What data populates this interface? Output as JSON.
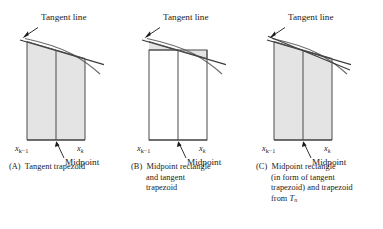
{
  "figure": {
    "type": "math-diagram",
    "fill_color": "#e4e4e4",
    "stroke_color": "#3a3a3a",
    "curve_color": "#555555",
    "background": "#ffffff"
  },
  "labels": {
    "tangent_line": "Tangent line",
    "midpoint": "Midpoint",
    "x_left_main": "x",
    "x_left_sub": "k−1",
    "x_right_main": "x",
    "x_right_sub": "k"
  },
  "panels": [
    {
      "id": "A",
      "tag": "(A)",
      "caption_lines": [
        "Tangent trapezoid"
      ],
      "shaded": "tangent-trapezoid-body"
    },
    {
      "id": "B",
      "tag": "(B)",
      "caption_lines": [
        "Midpoint rectangle",
        "and tangent",
        "trapezoid"
      ],
      "shaded": "two-corner-triangles"
    },
    {
      "id": "C",
      "tag": "(C)",
      "caption_lines": [
        "Midpoint rectangle",
        "(in form of tangent",
        "trapezoid) and trapezoid",
        "from Tn"
      ],
      "caption_last_italic": "T",
      "caption_last_sub": "n",
      "shaded": "tangent-trapezoid-body-with-chord"
    }
  ]
}
